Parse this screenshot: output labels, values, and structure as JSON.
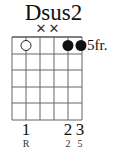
{
  "chord": {
    "name": "Dsus2",
    "base_fret_label": "5fr.",
    "strings": 6,
    "frets_shown": 5,
    "muted_marks": [
      {
        "string": 3,
        "symbol": "✕"
      },
      {
        "string": 4,
        "symbol": "✕"
      }
    ],
    "open_marks": [
      {
        "string": 2,
        "fret": 1,
        "symbol": "open-circle"
      }
    ],
    "dots": [
      {
        "string": 5,
        "fret": 1
      },
      {
        "string": 6,
        "fret": 1
      }
    ],
    "fingers": [
      {
        "string": 2,
        "label": "1"
      },
      {
        "string": 5,
        "label": "2"
      },
      {
        "string": 6,
        "label": "3"
      }
    ],
    "intervals": [
      {
        "string": 2,
        "label": "R"
      },
      {
        "string": 5,
        "label": "2"
      },
      {
        "string": 6,
        "label": "5"
      }
    ]
  }
}
